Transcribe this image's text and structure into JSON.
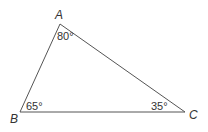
{
  "diagram": {
    "type": "triangle",
    "stroke_color": "#555555",
    "text_color": "#333333",
    "vertices": [
      {
        "name": "A",
        "x": 60,
        "y": 24,
        "label_x": 55,
        "label_y": 19
      },
      {
        "name": "B",
        "x": 20,
        "y": 112,
        "label_x": 10,
        "label_y": 123
      },
      {
        "name": "C",
        "x": 185,
        "y": 112,
        "label_x": 189,
        "label_y": 119
      }
    ],
    "angles": [
      {
        "vertex": "A",
        "label": "80°",
        "x": 57,
        "y": 40
      },
      {
        "vertex": "B",
        "label": "65°",
        "x": 26,
        "y": 110
      },
      {
        "vertex": "C",
        "label": "35°",
        "x": 151,
        "y": 110
      }
    ]
  }
}
